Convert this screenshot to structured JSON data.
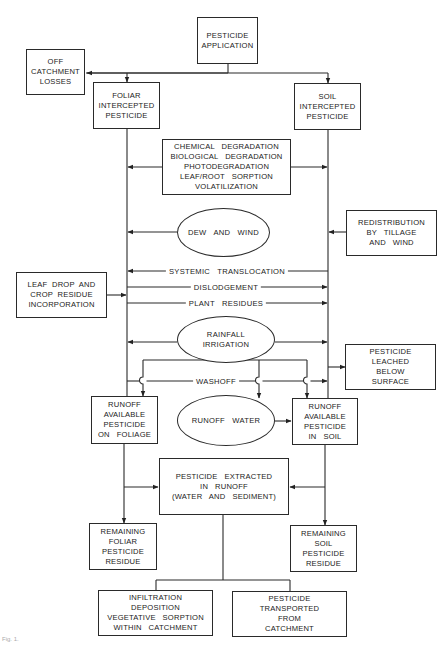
{
  "diagram": {
    "nodes": {
      "application": {
        "lines": [
          "PESTICIDE",
          "APPLICATION"
        ]
      },
      "off_catchment": {
        "lines": [
          "OFF",
          "CATCHMENT",
          "LOSSES"
        ]
      },
      "foliar": {
        "lines": [
          "FOLIAR",
          "INTERCEPTED",
          "PESTICIDE"
        ]
      },
      "soil": {
        "lines": [
          "SOIL",
          "INTERCEPTED",
          "PESTICIDE"
        ]
      },
      "degradation": {
        "lines": [
          "CHEMICAL   DEGRADATION",
          "BIOLOGICAL   DEGRADATION",
          "PHOTODEGRADATION",
          "LEAF/ROOT   SORPTION",
          "VOLATILIZATION"
        ]
      },
      "dew_wind": {
        "lines": [
          "DEW   AND   WIND"
        ]
      },
      "redistribution": {
        "lines": [
          "REDISTRIBUTION",
          "BY   TILLAGE",
          "AND   WIND"
        ]
      },
      "leaf_drop": {
        "lines": [
          "LEAF  DROP  AND",
          "CROP  RESIDUE",
          "INCORPORATION"
        ]
      },
      "rainfall": {
        "lines": [
          "RAINFALL",
          "IRRIGATION"
        ]
      },
      "leached": {
        "lines": [
          "PESTICIDE",
          "LEACHED",
          "BELOW",
          "SURFACE"
        ]
      },
      "runoff_foliage": {
        "lines": [
          "RUNOFF",
          "AVAILABLE",
          "PESTICIDE",
          "ON   FOLIAGE"
        ]
      },
      "runoff_water": {
        "lines": [
          "RUNOFF   WATER"
        ]
      },
      "runoff_soil": {
        "lines": [
          "RUNOFF",
          "AVAILABLE",
          "PESTICIDE",
          "IN   SOIL"
        ]
      },
      "extracted": {
        "lines": [
          "PESTICIDE   EXTRACTED",
          "IN   RUNOFF",
          "(WATER   AND   SEDIMENT)"
        ]
      },
      "remaining_foliar": {
        "lines": [
          "REMAINING",
          "FOLIAR",
          "PESTICIDE",
          "RESIDUE"
        ]
      },
      "remaining_soil": {
        "lines": [
          "REMAINING",
          "SOIL",
          "PESTICIDE",
          "RESIDUE"
        ]
      },
      "infiltration": {
        "lines": [
          "INFILTRATION",
          "DEPOSITION",
          "VEGETATIVE   SORPTION",
          "WITHIN   CATCHMENT"
        ]
      },
      "transported": {
        "lines": [
          "PESTICIDE",
          "TRANSPORTED",
          "FROM",
          "CATCHMENT"
        ]
      }
    },
    "edge_labels": {
      "systemic": "SYSTEMIC   TRANSLOCATION",
      "dislodgement": "DISLODGEMENT",
      "plant_residues": "PLANT   RESIDUES",
      "washoff": "WASHOFF"
    },
    "caption": "Fig. 1."
  }
}
